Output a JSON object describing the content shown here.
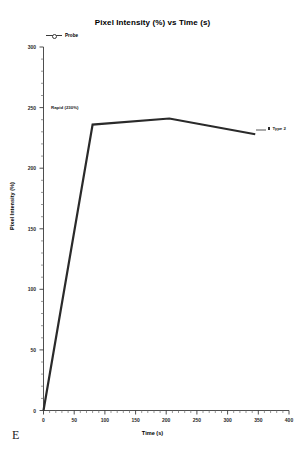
{
  "panel": {
    "label": "E"
  },
  "chart_data": {
    "type": "line",
    "title": "Pixel Intensity (%) vs Time (s)",
    "xlabel": "Time (s)",
    "ylabel": "Pixel Intensity (%)",
    "xlim": [
      0,
      400
    ],
    "ylim": [
      0,
      300
    ],
    "xticks": [
      0,
      50,
      100,
      150,
      200,
      250,
      300,
      350,
      400
    ],
    "xtick_labels": [
      "0",
      "50",
      "100",
      "150",
      "200",
      "250",
      "300",
      "350",
      "400"
    ],
    "yticks": [
      0,
      50,
      100,
      150,
      200,
      250,
      300
    ],
    "ytick_labels": [
      "0",
      "50",
      "100",
      "150",
      "200",
      "250",
      "300"
    ],
    "minor_tick_interval_x": 10,
    "minor_tick_interval_y": 10,
    "grid": false,
    "legend_position": "top-left",
    "legend": [
      {
        "name": "Probe",
        "marker": "circle-open",
        "color": "#3a3a3a"
      }
    ],
    "series": [
      {
        "name": "Probe",
        "color": "#2a2a2a",
        "line_width": 2.2,
        "x": [
          0,
          80,
          205,
          345
        ],
        "y": [
          0,
          236,
          241,
          228
        ]
      }
    ],
    "annotations": [
      {
        "name": "rapid-rise-annotation",
        "text": "Rapid (230%)",
        "x": 35,
        "y": 252
      },
      {
        "name": "type-2-annotation",
        "text": "Type 2",
        "marker": "square-filled",
        "x": 355,
        "y": 224
      }
    ]
  }
}
